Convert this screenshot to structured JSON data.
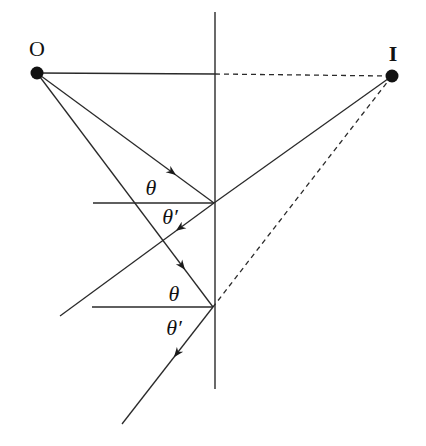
{
  "diagram": {
    "labels": {
      "object": "O",
      "image": "I",
      "incident_angle_1": "θ",
      "reflected_angle_1": "θ′",
      "incident_angle_2": "θ",
      "reflected_angle_2": "θ′"
    },
    "colors": {
      "line": "#2a2a2a",
      "point": "#111111",
      "background": "#ffffff"
    },
    "points": {
      "O": [
        37,
        73
      ],
      "I": [
        392,
        76
      ],
      "P1": [
        214,
        203
      ],
      "P2": [
        213,
        307
      ]
    },
    "mirror": {
      "x": 215,
      "y_top": 12,
      "y_bottom": 389
    }
  }
}
